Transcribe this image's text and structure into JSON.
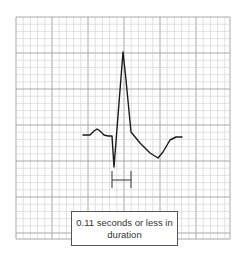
{
  "figure": {
    "label": "0.11 seconds or less in duration",
    "colors": {
      "grid_minor": "#d4d4d4",
      "grid_major": "#a8a8a8",
      "trace": "#1a1a1a",
      "caliper": "#444444",
      "label_border": "#555555"
    },
    "grid": {
      "left": 16,
      "top": 17,
      "right": 230,
      "bottom": 239,
      "minor": 7.2,
      "major": 36
    },
    "trace_points": [
      [
        83,
        135
      ],
      [
        90,
        135
      ],
      [
        94,
        131
      ],
      [
        97,
        129
      ],
      [
        100,
        131
      ],
      [
        104,
        135
      ],
      [
        108,
        136
      ],
      [
        112,
        136
      ],
      [
        114,
        167
      ],
      [
        123,
        52
      ],
      [
        126,
        80
      ],
      [
        131,
        132
      ],
      [
        140,
        143
      ],
      [
        150,
        153
      ],
      [
        158,
        158
      ],
      [
        163,
        152
      ],
      [
        170,
        140
      ],
      [
        176,
        137
      ],
      [
        182,
        137
      ]
    ],
    "caliper": {
      "x1": 112,
      "x2": 131,
      "y_top": 171,
      "y_bottom": 188,
      "y_bar": 180
    }
  }
}
